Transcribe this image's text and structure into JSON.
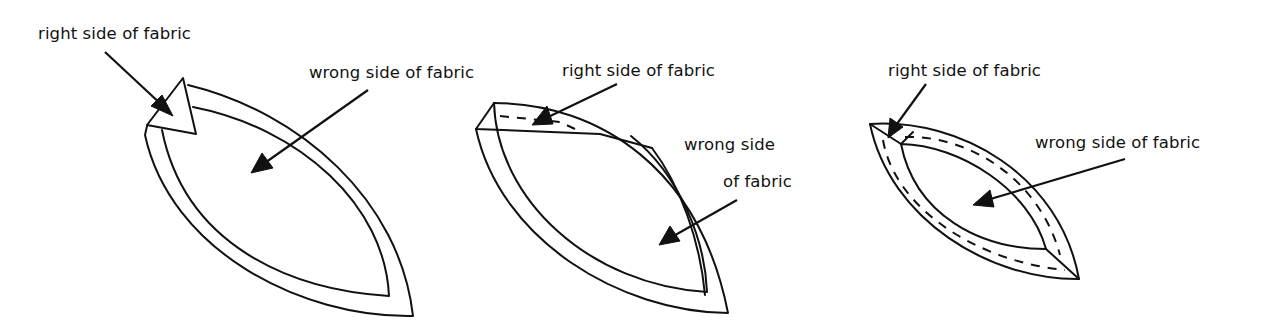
{
  "figures": [
    {
      "id": "step-1",
      "labels": {
        "right_side": "right side of fabric",
        "wrong_side": "wrong side of fabric"
      }
    },
    {
      "id": "step-2",
      "labels": {
        "right_side": "right side of fabric",
        "wrong_side_line1": "wrong side",
        "wrong_side_line2": "of fabric"
      }
    },
    {
      "id": "step-3",
      "labels": {
        "right_side": "right side of fabric",
        "wrong_side": "wrong side of fabric"
      }
    }
  ],
  "colors": {
    "ink": "#111111",
    "background": "#ffffff"
  }
}
